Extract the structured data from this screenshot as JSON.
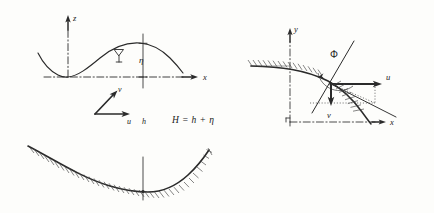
{
  "figure": {
    "background_color": "#fdfdfb",
    "ink_color": "#2a2a2a"
  },
  "panel_wave": {
    "name": "wave-profile-panel",
    "axis_z_label": "z",
    "axis_x_label": "x",
    "eta_label": "η",
    "surface_marker": "water-surface-triangle"
  },
  "panel_vectors": {
    "name": "velocity-vector-panel",
    "u_label": "u",
    "v_label": "v",
    "h_label": "h"
  },
  "equation": {
    "text": "H = h + η"
  },
  "panel_slope": {
    "name": "slope-velocity-panel",
    "axis_y_label": "y",
    "axis_x_label": "x",
    "angle_label": "Φ",
    "u_label": "u",
    "v_label": "v"
  },
  "panel_bed": {
    "name": "channel-bed-panel",
    "description": "concave bed profile with hatching below and vertical centre line"
  }
}
